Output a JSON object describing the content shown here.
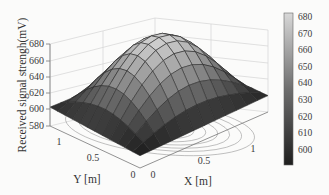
{
  "chart_data": {
    "type": "surface3d",
    "title": "",
    "xlabel": "X [m]",
    "ylabel": "Y [m]",
    "zlabel": "Received signal strengh(mV)",
    "x_ticks": [
      "0",
      "0.5",
      "1"
    ],
    "y_ticks": [
      "0",
      "0.5",
      "1"
    ],
    "z_ticks": [
      "580",
      "600",
      "620",
      "640",
      "660",
      "680"
    ],
    "zlim": [
      580,
      680
    ],
    "xlim": [
      0,
      1.2
    ],
    "ylim": [
      0,
      1.2
    ],
    "surface_description": "Dome-shaped surface peaking near the center of the XY domain (~680 mV) and falling to ~595-605 mV at the corners; contour lines projected on the base plane",
    "peak": {
      "x": 0.6,
      "y": 0.6,
      "z": 680
    },
    "corner_values": {
      "x0_y0": 595,
      "x0_y1.2": 603,
      "x1.2_y0": 600,
      "x1.2_y1.2": 600
    },
    "grid_on": true,
    "colorbar": {
      "position": "right",
      "colormap": "gray",
      "ticks": [
        "600",
        "610",
        "620",
        "630",
        "640",
        "650",
        "660",
        "670",
        "680"
      ],
      "range": [
        595,
        682
      ]
    }
  },
  "labels": {
    "zlabel": "Received signal strengh(mV)",
    "xlabel": "X [m]",
    "ylabel": "Y [m]"
  }
}
